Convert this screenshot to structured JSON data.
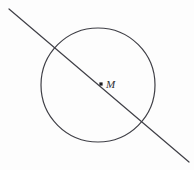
{
  "canvas": {
    "width": 194,
    "height": 170,
    "background_color": "#fdfdfd"
  },
  "diagram": {
    "type": "circle-with-secant-through-center",
    "stroke_color": "#3f3f46",
    "stroke_width": 1.2,
    "circle": {
      "name": "circle",
      "center_x": 98,
      "center_y": 85,
      "radius": 57
    },
    "center_point": {
      "name": "center-point-M",
      "x": 101,
      "y": 84,
      "size": 3.2,
      "fill_color": "#1c1c20"
    },
    "center_label": {
      "text": "M",
      "x": 106,
      "y": 88,
      "color": "#2e2e33",
      "font_size": 11,
      "style": "italic"
    },
    "line": {
      "name": "secant-line",
      "x1": 9,
      "y1": 9,
      "x2": 189,
      "y2": 162,
      "color": "#3f3f46",
      "width": 1.2
    },
    "intersections": [
      {
        "name": "intersection-upper-left",
        "x": 57,
        "y": 45
      },
      {
        "name": "intersection-lower-right",
        "x": 143,
        "y": 123
      }
    ]
  }
}
